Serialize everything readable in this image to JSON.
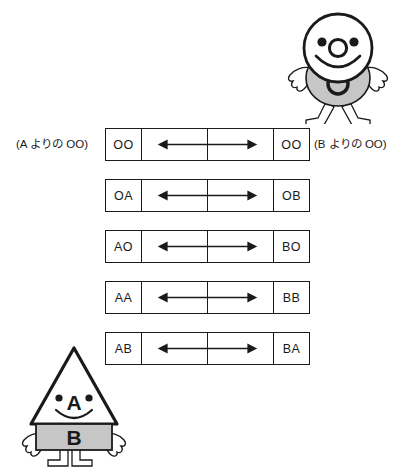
{
  "diagram": {
    "captions": {
      "left": "(A よりの OO)",
      "right": "(B よりの OO)"
    },
    "rows": [
      {
        "left": "OO",
        "right": "OO",
        "arrow": "double-headed-arrow"
      },
      {
        "left": "OA",
        "right": "OB",
        "arrow": "double-headed-arrow"
      },
      {
        "left": "AO",
        "right": "BO",
        "arrow": "double-headed-arrow"
      },
      {
        "left": "AA",
        "right": "BB",
        "arrow": "double-headed-arrow"
      },
      {
        "left": "AB",
        "right": "BA",
        "arrow": "double-headed-arrow"
      }
    ]
  },
  "figures": {
    "round": {
      "name": "round-character",
      "head_shape": "circle",
      "nose_label": "O",
      "body_label": "O",
      "body_color": "#c6c6c6",
      "head_color": "#ffffff",
      "outline_color": "#1a1a1a"
    },
    "triangle": {
      "name": "triangle-character",
      "head_shape": "triangle",
      "face_label": "A",
      "body_label": "B",
      "body_color": "#c6c6c6",
      "head_color": "#ffffff",
      "outline_color": "#1a1a1a"
    }
  },
  "colors": {
    "ink": "#1a1a1a",
    "gray_fill": "#c6c6c6",
    "paper": "#ffffff"
  }
}
